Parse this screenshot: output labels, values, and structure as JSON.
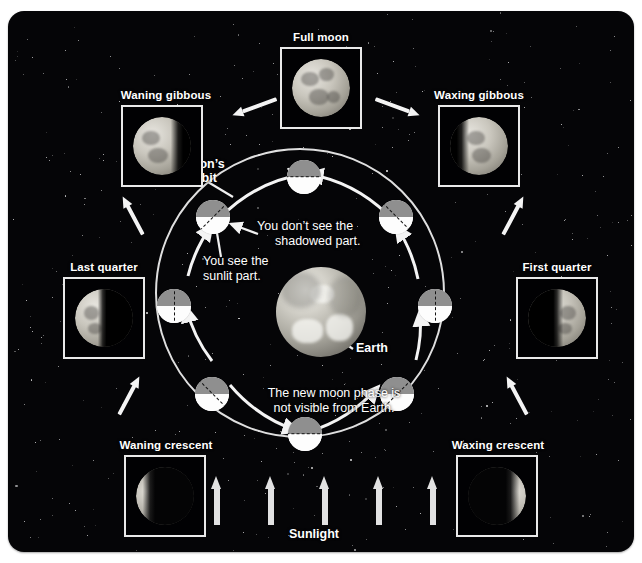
{
  "diagram": {
    "background_color": "#050507",
    "accent_color": "#ffffff",
    "orbit_moon_shadow_color": "#8f8f8f",
    "orbit_moon_sunlit_color": "#fdfdfd"
  },
  "phase_photos": [
    {
      "id": "full-moon",
      "label": "Full moon"
    },
    {
      "id": "waning-gibbous",
      "label": "Waning gibbous"
    },
    {
      "id": "waxing-gibbous",
      "label": "Waxing gibbous"
    },
    {
      "id": "last-quarter",
      "label": "Last quarter"
    },
    {
      "id": "first-quarter",
      "label": "First quarter"
    },
    {
      "id": "waning-crescent",
      "label": "Waning crescent"
    },
    {
      "id": "waxing-crescent",
      "label": "Waxing crescent"
    }
  ],
  "labels": {
    "moons_orbit_line1": "Moon’s",
    "moons_orbit_line2": "orbit",
    "shadowed_line1": "You don’t see the",
    "shadowed_line2": "shadowed part.",
    "sunlit_line1": "You see the",
    "sunlit_line2": "sunlit part.",
    "earth": "Earth",
    "new_moon_line1": "The new moon phase is",
    "new_moon_line2": "not visible from Earth.",
    "sunlight": "Sunlight"
  },
  "orbit_positions": [
    {
      "id": "new-moon-position",
      "angle_deg": 90,
      "phase": "new moon"
    },
    {
      "id": "waxing-crescent-position",
      "angle_deg": 135,
      "phase": "waxing crescent"
    },
    {
      "id": "first-quarter-position",
      "angle_deg": 180,
      "phase": "first quarter"
    },
    {
      "id": "waxing-gibbous-position",
      "angle_deg": 225,
      "phase": "waxing gibbous"
    },
    {
      "id": "full-moon-position",
      "angle_deg": 270,
      "phase": "full moon"
    },
    {
      "id": "waning-gibbous-position",
      "angle_deg": 315,
      "phase": "waning gibbous"
    },
    {
      "id": "last-quarter-position",
      "angle_deg": 0,
      "phase": "last quarter"
    },
    {
      "id": "waning-crescent-position",
      "angle_deg": 45,
      "phase": "waning crescent"
    }
  ],
  "sunlight_arrows": {
    "count": 5,
    "direction": "upward",
    "color": "#e2e2e2"
  }
}
